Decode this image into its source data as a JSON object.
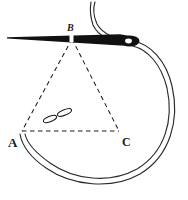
{
  "figure": {
    "background_color": "#ffffff",
    "ink_color": "#1a1a1a",
    "thread_color": "#2b2b2b",
    "width": 188,
    "height": 200
  },
  "labels": {
    "a": "A",
    "b": "B",
    "c": "C"
  },
  "triangle": {
    "style": "dashed",
    "vertices": [
      {
        "name": "A",
        "x": 22,
        "y": 131
      },
      {
        "name": "B",
        "x": 72,
        "y": 38
      },
      {
        "name": "C",
        "x": 119,
        "y": 131
      }
    ],
    "edges": [
      {
        "from": "A",
        "to": "B"
      },
      {
        "from": "B",
        "to": "C"
      },
      {
        "from": "A",
        "to": "C"
      }
    ]
  },
  "stitch_marks": [
    {
      "name": "stitch-mark-left",
      "cx": 50,
      "cy": 119,
      "rx": 7,
      "ry": 2.6,
      "rotation": -22
    },
    {
      "name": "stitch-mark-right",
      "cx": 64,
      "cy": 113,
      "rx": 7.5,
      "ry": 2.7,
      "rotation": -22
    }
  ],
  "needle": {
    "name": "sewing-needle",
    "tip_x": 8,
    "tip_y": 37,
    "eye_x": 131,
    "eye_y": 40,
    "shaft_color": "#111111",
    "eye_hole_color": "#ffffff"
  },
  "thread": {
    "name": "thread-loop",
    "color": "#2b2b2b",
    "description": "Double-line thread passing through needle eye, looping down right side and returning to vertex A"
  }
}
